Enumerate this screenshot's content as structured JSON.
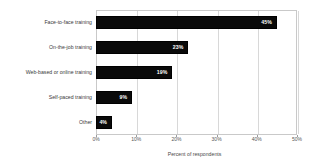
{
  "chart_data": {
    "type": "bar",
    "orientation": "horizontal",
    "title": "",
    "subtitle": "",
    "xlabel": "Percent of respondents",
    "ylabel": "",
    "categories": [
      "Face-to-face training",
      "On-the-job training",
      "Web-based or online training",
      "Self-paced training",
      "Other"
    ],
    "values": [
      45,
      23,
      19,
      9,
      4
    ],
    "data_labels": [
      "45%",
      "23%",
      "19%",
      "9%",
      "4%"
    ],
    "xlim": [
      0,
      50
    ],
    "xticks": [
      0,
      10,
      20,
      30,
      40,
      50
    ],
    "xtick_labels": [
      "0%",
      "10%",
      "20%",
      "30%",
      "40%",
      "50%"
    ],
    "grid": true,
    "grid_axis": "x",
    "legend": false,
    "legend_position": "none",
    "colors": {
      "bar": "#0a0a0a",
      "bar_border": "#000000",
      "data_label": "#ffffff",
      "gridline": "#d8d8d8",
      "plot_border": "#c9c9c9",
      "axis_text": "#555555",
      "category_text": "#3a3a3a",
      "background": "#ffffff"
    }
  }
}
